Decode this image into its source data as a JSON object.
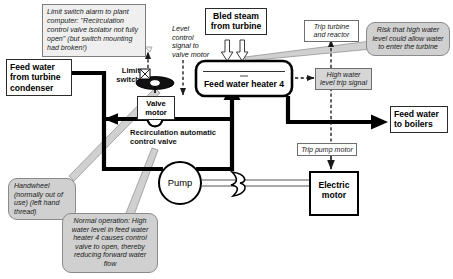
{
  "diagram": {
    "colors": {
      "pipe": "#000000",
      "callout_fill": "#d0d0d0",
      "signal_fill": "#d6d6d6",
      "note_fill": "#efefef",
      "outline": "#2b2b2b"
    }
  },
  "notes": {
    "limit_switch_alarm": "Limit switch alarm to plant computer: \"Recirculation control valve isolator not fully open\" (but switch mounting had broken!)"
  },
  "boxes": {
    "feed_water_from_condenser": "Feed water from turbine condenser",
    "bled_steam": "Bled steam from turbine",
    "feed_water_heater": "Feed water heater 4",
    "feed_water_to_boilers": "Feed water to boilers",
    "electric_motor": "Electric motor",
    "valve_motor": "Valve motor"
  },
  "signals": {
    "trip_turbine_reactor": "Trip turbine and reactor",
    "high_water_level_trip": "High water level trip signal",
    "trip_pump_motor": "Trip pump motor",
    "level_control_signal": "Level control signal to valve motor"
  },
  "labels": {
    "limit_switch": "Limit switch",
    "recirculation_valve": "Recirculation automatic control valve",
    "pump": "Pump"
  },
  "callouts": {
    "handwheel": "Handwheel (normally out of use) (left hand thread)",
    "normal_operation": "Normal operation: High water level in feed water heater 4 causes control valve to open, thereby reducing forward water flow",
    "risk": "Risk that high water level could allow water to enter the turbine"
  }
}
